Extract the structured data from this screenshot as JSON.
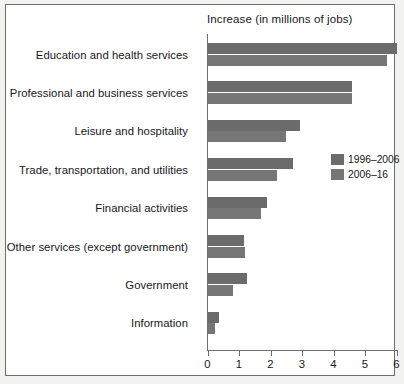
{
  "chart_data": {
    "type": "bar",
    "orientation": "horizontal",
    "title": "Increase (in millions of jobs)",
    "xlabel": "",
    "ylabel": "",
    "xlim": [
      0,
      6
    ],
    "xticks": [
      "0",
      "1",
      "2",
      "3",
      "4",
      "5",
      "6"
    ],
    "grid": false,
    "legend_position": "middle-right",
    "categories": [
      "Education and health services",
      "Professional and business services",
      "Leisure and hospitality",
      "Trade, transportation, and utilities",
      "Financial activities",
      "Other services (except government)",
      "Government",
      "Information"
    ],
    "series": [
      {
        "name": "1996–2006",
        "color": "#6b6b6b",
        "values": [
          6.0,
          4.6,
          2.95,
          2.7,
          1.9,
          1.15,
          1.25,
          0.35
        ]
      },
      {
        "name": "2006–16",
        "color": "#767676",
        "values": [
          5.7,
          4.6,
          2.5,
          2.2,
          1.7,
          1.2,
          0.8,
          0.25
        ]
      }
    ]
  },
  "legend": {
    "items": [
      {
        "label": "1996–2006",
        "color": "#6b6b6b"
      },
      {
        "label": "2006–16",
        "color": "#767676"
      }
    ]
  },
  "colors": {
    "series_1996_2006": "#6b6b6b",
    "series_2006_16": "#767676",
    "axis": "#6f6f6f",
    "text": "#17171a",
    "plot_background": "#ffffff",
    "page_background": "#f2f2f0"
  }
}
